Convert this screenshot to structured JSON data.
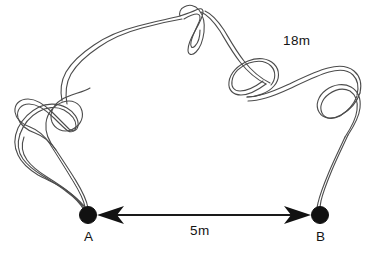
{
  "figure": {
    "type": "geometry-diagram",
    "background_color": "#ffffff",
    "width": 389,
    "height": 257
  },
  "labels": {
    "rope_length": "18m",
    "distance": "5m",
    "point_a": "A",
    "point_b": "B"
  },
  "measurements": {
    "rope_length_value": 18,
    "rope_length_unit": "m",
    "straight_distance_value": 5,
    "straight_distance_unit": "m"
  },
  "points": [
    {
      "name": "A",
      "x": 88,
      "y": 215
    },
    {
      "name": "B",
      "x": 320,
      "y": 215
    }
  ],
  "colors": {
    "rope_stroke": "#4c4c4c",
    "dimension_line": "#1a1a1a",
    "node_fill": "#111111",
    "text": "#141414"
  },
  "dimension_arrow": {
    "from_x": 98,
    "to_x": 310,
    "y": 215,
    "double_headed": true
  }
}
